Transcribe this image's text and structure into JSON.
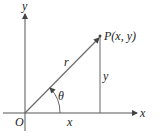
{
  "diagram": {
    "type": "polar-coordinates",
    "labels": {
      "y_axis": "y",
      "x_axis": "x",
      "origin": "O",
      "point": "P(x, y)",
      "radius": "r",
      "angle": "θ",
      "horizontal_leg": "x",
      "vertical_leg": "y"
    },
    "colors": {
      "axis": "#555555",
      "vector": "#6b6b6b",
      "text": "#222222"
    }
  }
}
